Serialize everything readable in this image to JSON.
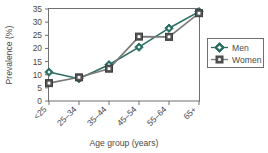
{
  "chart_data": {
    "type": "line",
    "title": "",
    "xlabel": "Age group (years)",
    "ylabel": "Prevalence (%)",
    "categories": [
      "<25",
      "25–34",
      "35–44",
      "45–54",
      "55–64",
      "65+"
    ],
    "series": [
      {
        "name": "Men",
        "values": [
          11.0,
          8.5,
          13.8,
          20.5,
          27.7,
          34.0
        ],
        "color": "#2a6e63",
        "marker": "diamond"
      },
      {
        "name": "Women",
        "values": [
          6.8,
          9.0,
          12.3,
          24.5,
          24.4,
          33.4
        ],
        "color": "#7a7a7a",
        "marker": "square"
      }
    ],
    "ylim": [
      0,
      35
    ],
    "yticks": [
      0,
      5,
      10,
      15,
      20,
      25,
      30,
      35
    ],
    "ytick_labels": [
      "0",
      "5",
      "10",
      "15",
      "20",
      "25",
      "30",
      "35"
    ],
    "grid": false,
    "legend_position": "right",
    "legend_entries": [
      "Men",
      "Women"
    ]
  },
  "legend": {
    "men_label": "Men",
    "women_label": "Women",
    "men_marker_name": "diamond-marker-icon",
    "women_marker_name": "square-marker-icon"
  },
  "axes": {
    "y_title": "Prevalence (%)",
    "x_title": "Age group (years)"
  }
}
